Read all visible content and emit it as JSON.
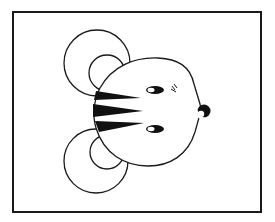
{
  "illustration": {
    "subject": "cartoon mouse face with tiger stripes, facing right",
    "colors": {
      "stroke": "#1a1a1a",
      "fill": "#ffffff",
      "background": "#ffffff"
    },
    "elements": [
      "frame",
      "upper-ear",
      "lower-ear",
      "head",
      "stripes",
      "upper-eye",
      "lower-eye",
      "blush-marks",
      "nose"
    ],
    "stripe_count": 3
  }
}
